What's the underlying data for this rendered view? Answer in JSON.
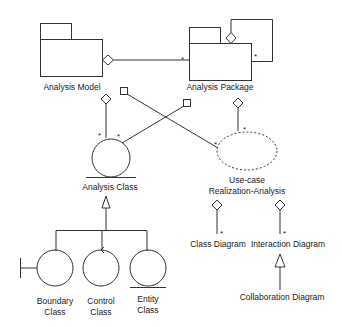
{
  "diagram": {
    "type": "UML analysis model",
    "stroke_color": "#333333",
    "nodes": {
      "analysis_model": {
        "label": "Analysis Model",
        "shape": "package"
      },
      "analysis_package": {
        "label": "Analysis Package",
        "shape": "package"
      },
      "analysis_class": {
        "label": "Analysis Class",
        "shape": "circle"
      },
      "use_case_realization": {
        "label_line1": "Use-case",
        "label_line2": "Realization-Analysis",
        "shape": "dashed-ellipse"
      },
      "class_diagram": {
        "label": "Class Diagram"
      },
      "interaction_diagram": {
        "label": "Interaction Diagram"
      },
      "collaboration_diagram": {
        "label": "Collaboration Diagram"
      },
      "boundary_class": {
        "label_line1": "Boundary",
        "label_line2": "Class"
      },
      "control_class": {
        "label_line1": "Control",
        "label_line2": "Class"
      },
      "entity_class": {
        "label_line1": "Entity",
        "label_line2": "Class"
      }
    },
    "multiplicity": "*",
    "edges": [
      {
        "from": "Analysis Model",
        "to": "Analysis Package",
        "type": "aggregation",
        "multiplicity": "*"
      },
      {
        "from": "Analysis Package",
        "to": "Analysis Package",
        "type": "aggregation",
        "multiplicity": "*"
      },
      {
        "from": "Analysis Model",
        "to": "Analysis Class",
        "type": "aggregation",
        "multiplicity": "*"
      },
      {
        "from": "Analysis Model",
        "to": "Use-case Realization-Analysis",
        "type": "association",
        "multiplicity": "*"
      },
      {
        "from": "Analysis Package",
        "to": "Analysis Class",
        "type": "association",
        "multiplicity": "*"
      },
      {
        "from": "Analysis Package",
        "to": "Use-case Realization-Analysis",
        "type": "aggregation",
        "multiplicity": "*"
      },
      {
        "from": "Use-case Realization-Analysis",
        "to": "Class Diagram",
        "type": "aggregation",
        "multiplicity": "*"
      },
      {
        "from": "Use-case Realization-Analysis",
        "to": "Interaction Diagram",
        "type": "aggregation",
        "multiplicity": "*"
      },
      {
        "from": "Collaboration Diagram",
        "to": "Interaction Diagram",
        "type": "generalization"
      },
      {
        "from": "Boundary Class",
        "to": "Analysis Class",
        "type": "generalization"
      },
      {
        "from": "Control Class",
        "to": "Analysis Class",
        "type": "generalization"
      },
      {
        "from": "Entity Class",
        "to": "Analysis Class",
        "type": "generalization"
      }
    ]
  }
}
